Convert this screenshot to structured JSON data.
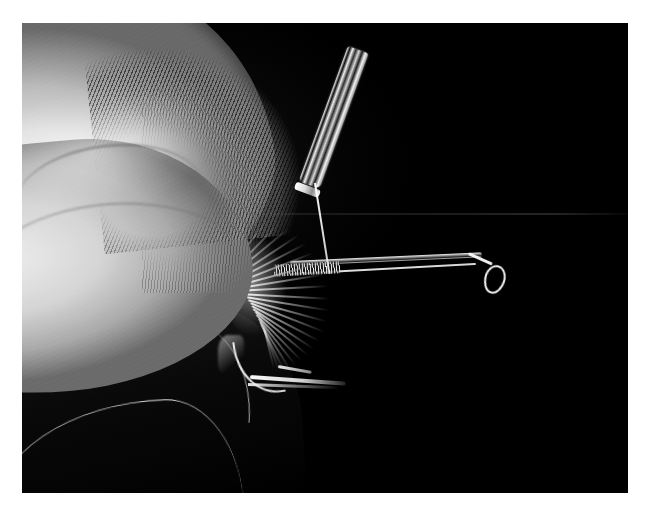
{
  "page": {
    "background_color": "#ffffff",
    "width": 648,
    "height": 505
  },
  "photo": {
    "title": "Fly tying: hackle pinched against hook shank",
    "description": "Black and white macro photograph of a fly tyer's fingertip pressing a bundle of hackle fibers against the shank of a fishing hook held in a vise, with a bobbin tube and tying thread above.",
    "palette": {
      "background": "#050505",
      "highlight": "#ffffff",
      "skin_light": "#efeeec",
      "skin_mid": "#b9b6b1",
      "skin_shadow": "#6d6a66",
      "metal": "#f5f4f2",
      "vise_dark": "#101010",
      "plate_border": "#ffffff"
    },
    "frame": {
      "left": 22,
      "top": 23,
      "width": 606,
      "height": 470
    },
    "color_mode": "black-and-white",
    "subjects": [
      {
        "name": "fingertip",
        "label": "Fingertip and thumb pad"
      },
      {
        "name": "fingerprint-ridges",
        "label": "Fingerprint ridges"
      },
      {
        "name": "fingernail",
        "label": "Fingernail edge"
      },
      {
        "name": "hackle",
        "label": "Hackle fibers"
      },
      {
        "name": "hook",
        "label": "Fishing hook"
      },
      {
        "name": "hook-eye",
        "label": "Hook eye"
      },
      {
        "name": "hook-point",
        "label": "Hook point and barb"
      },
      {
        "name": "bobbin",
        "label": "Bobbin tube"
      },
      {
        "name": "thread",
        "label": "Tying thread"
      },
      {
        "name": "vise",
        "label": "Vise jaw"
      },
      {
        "name": "backdrop-seam",
        "label": "Backdrop seam line"
      }
    ]
  }
}
